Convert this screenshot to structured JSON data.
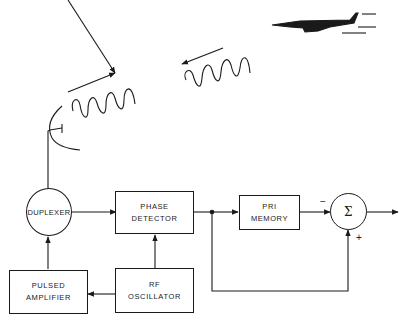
{
  "diagram": {
    "type": "block-diagram",
    "colors": {
      "line": "#1a1a1a",
      "background": "#ffffff"
    },
    "illustrations": {
      "target": "jet-aircraft-icon",
      "antenna": "dish-antenna-icon",
      "transmitted_wave": "outgoing-sine-wave",
      "echo_wave": "returning-sine-wave"
    },
    "blocks": {
      "duplexer": {
        "label": "DUPLEXER"
      },
      "phase_detector": {
        "line1": "PHASE",
        "line2": "DETECTOR"
      },
      "pri_memory": {
        "line1": "PRI",
        "line2": "MEMORY"
      },
      "summer": {
        "symbol": "Σ",
        "minus": "−",
        "plus": "+"
      },
      "pulsed_amplifier": {
        "line1": "PULSED",
        "line2": "AMPLIFIER"
      },
      "rf_oscillator": {
        "line1": "RF",
        "line2": "OSCILLATOR"
      }
    },
    "connections": [
      {
        "from": "antenna",
        "to": "duplexer"
      },
      {
        "from": "duplexer",
        "to": "phase_detector"
      },
      {
        "from": "rf_oscillator",
        "to": "phase_detector"
      },
      {
        "from": "rf_oscillator",
        "to": "pulsed_amplifier"
      },
      {
        "from": "pulsed_amplifier",
        "to": "duplexer"
      },
      {
        "from": "phase_detector",
        "to": "pri_memory"
      },
      {
        "from": "pri_memory",
        "to": "summer",
        "sign": "−"
      },
      {
        "from": "phase_detector",
        "to": "summer",
        "sign": "+"
      },
      {
        "from": "summer",
        "to": "output"
      }
    ]
  }
}
